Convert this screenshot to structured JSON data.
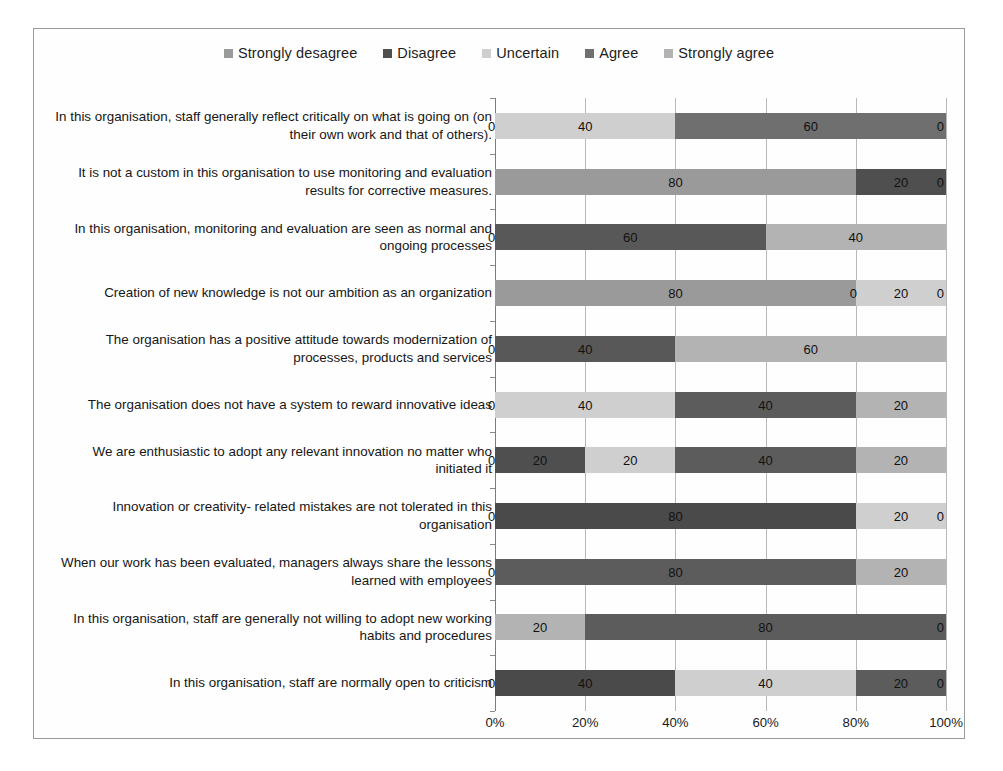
{
  "chart_data": {
    "type": "bar",
    "orientation": "horizontal",
    "stacked": true,
    "stack_mode": "percent",
    "title": "",
    "xlabel": "",
    "ylabel": "",
    "xlim": [
      0,
      100
    ],
    "xtick_labels": [
      "0%",
      "20%",
      "40%",
      "60%",
      "80%",
      "100%"
    ],
    "xticks": [
      0,
      20,
      40,
      60,
      80,
      100
    ],
    "grid": true,
    "legend_position": "top",
    "legend": [
      {
        "name": "Strongly desagree",
        "color": "#9a9a9a"
      },
      {
        "name": "Disagree",
        "color": "#4f4f4f"
      },
      {
        "name": "Uncertain",
        "color": "#cfcfcf"
      },
      {
        "name": "Agree",
        "color": "#6f6f6f"
      },
      {
        "name": "Strongly agree",
        "color": "#b3b3b3"
      }
    ],
    "series": [
      {
        "name": "Strongly desagree",
        "values": [
          0,
          80,
          0,
          80,
          0,
          0,
          0,
          0,
          0,
          20,
          0
        ]
      },
      {
        "name": "Disagree",
        "values": [
          0,
          20,
          60,
          0,
          40,
          0,
          20,
          80,
          0,
          0,
          40
        ]
      },
      {
        "name": "Uncertain",
        "values": [
          40,
          0,
          0,
          20,
          0,
          40,
          20,
          20,
          0,
          0,
          40
        ]
      },
      {
        "name": "Agree",
        "values": [
          60,
          0,
          0,
          0,
          0,
          40,
          40,
          0,
          80,
          80,
          20
        ]
      },
      {
        "name": "Strongly agree",
        "values": [
          0,
          0,
          40,
          0,
          60,
          20,
          20,
          0,
          20,
          0,
          0
        ]
      }
    ],
    "categories": [
      "In this organisation, staff generally reflect critically on what is going on (on their own work and that of others).",
      "It is not a custom in this organisation to use monitoring and evaluation results for corrective measures.",
      "In this organisation, monitoring and evaluation are seen as normal and ongoing processes",
      "Creation of new knowledge is not our ambition as an organization",
      "The organisation has a positive attitude towards modernization of processes, products and services",
      "The organisation does not have a system to reward innovative ideas",
      "We are enthusiastic to adopt any relevant innovation no matter who initiated it",
      "Innovation or creativity- related mistakes are not tolerated in this organisation",
      "When our work has been evaluated, managers always share the lessons learned with employees",
      "In this organisation, staff are generally not willing to adopt new working habits and procedures",
      "In this organisation, staff are normally open to criticism"
    ],
    "rows": [
      {
        "category": "In this organisation, staff generally reflect critically on what is going on (on their own work and that of others).",
        "left_cap": "0",
        "right_cap": "0",
        "segments": [
          {
            "series": "Uncertain",
            "value": 40,
            "label": "40",
            "color": "#cfcfcf"
          },
          {
            "series": "Agree",
            "value": 60,
            "label": "60",
            "color": "#6f6f6f"
          }
        ]
      },
      {
        "category": "It is not a custom in this organisation to use monitoring and evaluation results for corrective measures.",
        "left_cap": "",
        "right_cap": "0",
        "segments": [
          {
            "series": "Strongly desagree",
            "value": 80,
            "label": "80",
            "color": "#9a9a9a"
          },
          {
            "series": "Disagree",
            "value": 20,
            "label": "20",
            "color": "#4f4f4f"
          }
        ]
      },
      {
        "category": "In this organisation, monitoring and evaluation are seen as normal and ongoing processes",
        "left_cap": "0",
        "right_cap": "",
        "segments": [
          {
            "series": "Disagree",
            "value": 60,
            "label": "60",
            "color": "#585858"
          },
          {
            "series": "Strongly agree",
            "value": 40,
            "label": "40",
            "color": "#b3b3b3"
          }
        ]
      },
      {
        "category": "Creation of new knowledge is not our ambition as an organization",
        "left_cap": "",
        "right_cap": "0",
        "segments": [
          {
            "series": "Strongly desagree",
            "value": 80,
            "label": "80",
            "color": "#9a9a9a"
          },
          {
            "series": "Uncertain",
            "value": 20,
            "label": "20",
            "color": "#cfcfcf",
            "lead_zero": "0"
          }
        ]
      },
      {
        "category": "The organisation has a positive attitude towards modernization of processes, products and services",
        "left_cap": "0",
        "right_cap": "",
        "segments": [
          {
            "series": "Disagree",
            "value": 40,
            "label": "40",
            "color": "#585858"
          },
          {
            "series": "Strongly agree",
            "value": 60,
            "label": "60",
            "color": "#b3b3b3"
          }
        ]
      },
      {
        "category": "The organisation does not have a system to reward innovative ideas",
        "left_cap": "0",
        "right_cap": "",
        "segments": [
          {
            "series": "Uncertain",
            "value": 40,
            "label": "40",
            "color": "#cfcfcf"
          },
          {
            "series": "Agree",
            "value": 40,
            "label": "40",
            "color": "#5c5c5c"
          },
          {
            "series": "Strongly agree",
            "value": 20,
            "label": "20",
            "color": "#b3b3b3"
          }
        ]
      },
      {
        "category": "We are enthusiastic to adopt any relevant innovation no matter who initiated it",
        "left_cap": "0",
        "right_cap": "",
        "segments": [
          {
            "series": "Disagree",
            "value": 20,
            "label": "20",
            "color": "#4f4f4f"
          },
          {
            "series": "Uncertain",
            "value": 20,
            "label": "20",
            "color": "#cfcfcf"
          },
          {
            "series": "Agree",
            "value": 40,
            "label": "40",
            "color": "#5c5c5c"
          },
          {
            "series": "Strongly agree",
            "value": 20,
            "label": "20",
            "color": "#b3b3b3"
          }
        ]
      },
      {
        "category": "Innovation or creativity- related mistakes are not tolerated in this organisation",
        "left_cap": "0",
        "right_cap": "0",
        "segments": [
          {
            "series": "Disagree",
            "value": 80,
            "label": "80",
            "color": "#4a4a4a"
          },
          {
            "series": "Uncertain",
            "value": 20,
            "label": "20",
            "color": "#cfcfcf"
          }
        ]
      },
      {
        "category": "When our work has been evaluated, managers always share the lessons learned with employees",
        "left_cap": "0",
        "right_cap": "",
        "segments": [
          {
            "series": "Agree",
            "value": 80,
            "label": "80",
            "color": "#5c5c5c"
          },
          {
            "series": "Strongly agree",
            "value": 20,
            "label": "20",
            "color": "#b3b3b3"
          }
        ]
      },
      {
        "category": "In this organisation, staff are generally not willing to adopt new working habits and procedures",
        "left_cap": "",
        "right_cap": "0",
        "segments": [
          {
            "series": "Strongly desagree",
            "value": 20,
            "label": "20",
            "color": "#b3b3b3"
          },
          {
            "series": "Agree",
            "value": 80,
            "label": "80",
            "color": "#5c5c5c"
          }
        ]
      },
      {
        "category": "In this organisation, staff are normally open to criticism",
        "left_cap": "0",
        "right_cap": "0",
        "segments": [
          {
            "series": "Disagree",
            "value": 40,
            "label": "40",
            "color": "#4a4a4a"
          },
          {
            "series": "Uncertain",
            "value": 40,
            "label": "40",
            "color": "#cfcfcf"
          },
          {
            "series": "Agree",
            "value": 20,
            "label": "20",
            "color": "#5c5c5c"
          }
        ]
      }
    ]
  }
}
